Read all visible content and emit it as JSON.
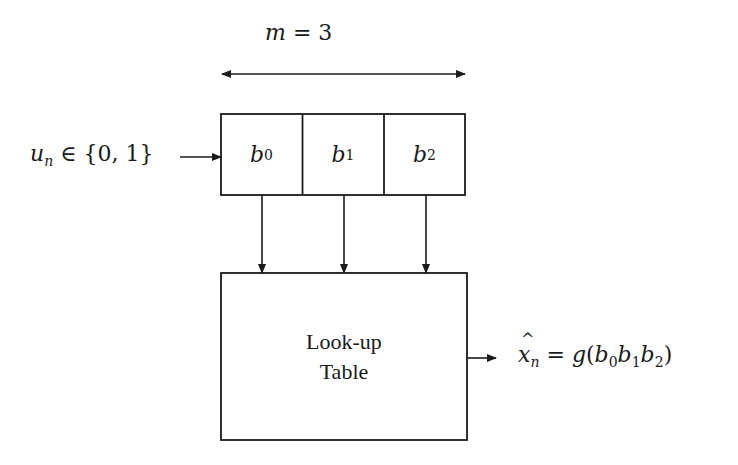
{
  "diagram": {
    "type": "block-diagram",
    "width_annotation": {
      "var": "m",
      "eq": "=",
      "value": "3"
    },
    "input": {
      "var": "u",
      "sub": "n",
      "relation": "∈",
      "set": "{0, 1}"
    },
    "register": {
      "cells": [
        {
          "var": "b",
          "sub": "0"
        },
        {
          "var": "b",
          "sub": "1"
        },
        {
          "var": "b",
          "sub": "2"
        }
      ]
    },
    "lookup_table": {
      "line1": "Look-up",
      "line2": "Table"
    },
    "output": {
      "var": "x",
      "hat": true,
      "sub": "n",
      "eq": "=",
      "func": "g",
      "args": [
        {
          "var": "b",
          "sub": "0"
        },
        {
          "var": "b",
          "sub": "1"
        },
        {
          "var": "b",
          "sub": "2"
        }
      ]
    },
    "colors": {
      "stroke": "#1a1a1a",
      "background": "#ffffff"
    }
  }
}
